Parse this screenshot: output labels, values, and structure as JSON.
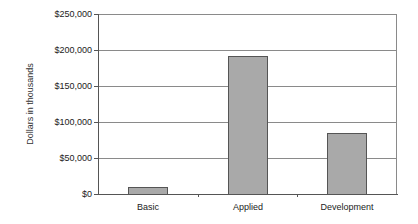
{
  "chart_data": {
    "type": "bar",
    "title": "",
    "xlabel": "",
    "ylabel": "Dollars in thousands",
    "categories": [
      "Basic",
      "Applied",
      "Development"
    ],
    "values": [
      10000,
      192000,
      85000
    ],
    "ylim": [
      0,
      250000
    ],
    "yticks": [
      0,
      50000,
      100000,
      150000,
      200000,
      250000
    ],
    "ytick_labels": [
      "$0",
      "$50,000",
      "$100,000",
      "$150,000",
      "$200,000",
      "$250,000"
    ],
    "grid": true,
    "legend": null,
    "bar_color": "#a9a9a9",
    "bar_edge_color": "#555555"
  }
}
